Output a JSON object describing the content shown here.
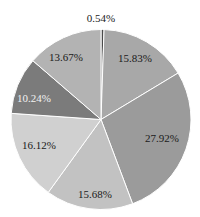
{
  "chart_data": {
    "type": "pie",
    "title": "",
    "start_angle_deg": 90,
    "direction": "clockwise",
    "slices": [
      {
        "label": "0.54%",
        "value": 0.54,
        "color": "#4a4a4a"
      },
      {
        "label": "15.83%",
        "value": 15.83,
        "color": "#a8a8a8"
      },
      {
        "label": "27.92%",
        "value": 27.92,
        "color": "#9b9b9b"
      },
      {
        "label": "15.68%",
        "value": 15.68,
        "color": "#c2c2c2"
      },
      {
        "label": "16.12%",
        "value": 16.12,
        "color": "#d0d0d0"
      },
      {
        "label": "10.24%",
        "value": 10.24,
        "color": "#7b7b7b",
        "label_color": "#f2f2f2"
      },
      {
        "label": "13.67%",
        "value": 13.67,
        "color": "#b3b3b3"
      }
    ],
    "values": [
      0.54,
      15.83,
      27.92,
      15.68,
      16.12,
      10.24,
      13.67
    ],
    "labels": [
      "0.54%",
      "15.83%",
      "27.92%",
      "15.68%",
      "16.12%",
      "10.24%",
      "13.67%"
    ],
    "legend": null
  }
}
